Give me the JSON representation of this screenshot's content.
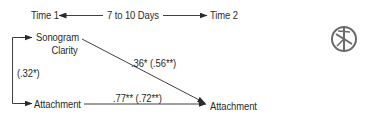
{
  "header": {
    "time1": "Time 1",
    "interval": "7 to 10 Days",
    "time2": "Time 2"
  },
  "nodes": {
    "sonogram_clarity_line1": "Sonogram",
    "sonogram_clarity_line2": "Clarity",
    "attachment_time1": "Attachment",
    "attachment_time2": "Attachment"
  },
  "paths": {
    "correlation_t1": "(.32*)",
    "sonogram_to_attachment": ".36* (.56**)",
    "attachment_stability": ".77** (.72**)"
  },
  "icons": {
    "badge": "asterisk-circle-icon"
  },
  "colors": {
    "line": "#2a2a2a",
    "text": "#2a2a2a",
    "icon": "#6a6a6a"
  }
}
